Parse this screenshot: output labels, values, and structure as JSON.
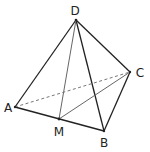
{
  "diagram": {
    "type": "tetrahedron",
    "points": {
      "D": {
        "label": "D",
        "x": 76,
        "y": 20,
        "lx": 75,
        "ly": 15
      },
      "A": {
        "label": "A",
        "x": 15,
        "y": 107,
        "lx": 8,
        "ly": 112
      },
      "M": {
        "label": "M",
        "x": 59,
        "y": 119,
        "lx": 59,
        "ly": 136
      },
      "B": {
        "label": "B",
        "x": 104,
        "y": 131,
        "lx": 104,
        "ly": 147
      },
      "C": {
        "label": "C",
        "x": 130,
        "y": 72,
        "lx": 140,
        "ly": 77
      }
    },
    "edges": [
      {
        "from": "A",
        "to": "D",
        "style": "solid"
      },
      {
        "from": "D",
        "to": "C",
        "style": "solid"
      },
      {
        "from": "D",
        "to": "B",
        "style": "solid"
      },
      {
        "from": "A",
        "to": "B",
        "style": "solid"
      },
      {
        "from": "B",
        "to": "C",
        "style": "solid"
      },
      {
        "from": "D",
        "to": "M",
        "style": "solid-gray"
      },
      {
        "from": "M",
        "to": "C",
        "style": "solid-gray"
      },
      {
        "from": "A",
        "to": "C",
        "style": "dashed"
      }
    ],
    "colors": {
      "edge": "#222222",
      "gray_edge": "#666666",
      "dashed": "#777777"
    }
  }
}
